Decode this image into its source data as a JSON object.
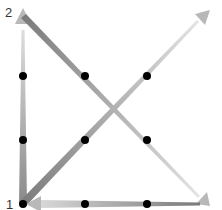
{
  "diagram": {
    "type": "directed-graph",
    "nodes": [
      {
        "id": "1",
        "label": "1",
        "x": 23,
        "y": 204
      },
      {
        "id": "2",
        "label": "2",
        "x": 23,
        "y": 14
      }
    ],
    "corners": {
      "top_left": [
        23,
        14
      ],
      "top_right": [
        207,
        14
      ],
      "bottom_left": [
        23,
        204
      ],
      "bottom_right": [
        207,
        204
      ]
    },
    "edges": [
      {
        "from": "bottom_left",
        "to": "top_left",
        "note": "left vertical, arrow at node 2"
      },
      {
        "from": "top_left",
        "to": "bottom_right",
        "note": "diagonal, arrow at bottom-right"
      },
      {
        "from": "bottom_left",
        "to": "top_right",
        "note": "diagonal, arrow at top-right"
      },
      {
        "from": "bottom_right",
        "to": "bottom_left",
        "note": "bottom horizontal, arrow at node 1"
      }
    ],
    "dots": [
      [
        23,
        76
      ],
      [
        23,
        140
      ],
      [
        85,
        76
      ],
      [
        147,
        76
      ],
      [
        85,
        140
      ],
      [
        147,
        140
      ],
      [
        85,
        204
      ],
      [
        147,
        204
      ],
      [
        23,
        204
      ]
    ],
    "colors": {
      "edge": "#9a9a9a",
      "arrow": "#b8b8b8",
      "dot": "#000000",
      "label": "#333333"
    }
  }
}
